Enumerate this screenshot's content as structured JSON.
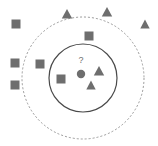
{
  "figure": {
    "width": 158,
    "height": 146,
    "background": "#ffffff"
  },
  "colors": {
    "marker_fill": "#6e6e6e",
    "inner_ring_stroke": "#4a4a4a",
    "outer_ring_stroke": "#9a9a9a",
    "query_dot": "#6e6e6e",
    "query_label": "#6e6e6e"
  },
  "query_point": {
    "label": "?",
    "label_x": 81,
    "label_y": 63,
    "dot_x": 81,
    "dot_y": 74,
    "dot_radius": 4.2
  },
  "rings": [
    {
      "name": "inner-neighborhood",
      "style": "solid",
      "cx": 83,
      "cy": 78,
      "r": 34,
      "stroke": "#4a4a4a",
      "stroke_width": 1.2,
      "dash": "none"
    },
    {
      "name": "outer-neighborhood",
      "style": "dashed",
      "cx": 83,
      "cy": 78,
      "r": 61,
      "stroke": "#9a9a9a",
      "stroke_width": 1,
      "dash": "2,2"
    }
  ],
  "legend_classes": [
    {
      "name": "class-square",
      "glyph": "square"
    },
    {
      "name": "class-triangle",
      "glyph": "triangle"
    }
  ],
  "markers": [
    {
      "id": "square-1",
      "shape": "square",
      "x": 16,
      "y": 24,
      "size": 9,
      "zone": "outside"
    },
    {
      "id": "square-2",
      "shape": "square",
      "x": 15,
      "y": 63,
      "size": 9,
      "zone": "outer-ring"
    },
    {
      "id": "square-3",
      "shape": "square",
      "x": 40,
      "y": 64,
      "size": 9,
      "zone": "outer-ring"
    },
    {
      "id": "square-4",
      "shape": "square",
      "x": 15,
      "y": 85,
      "size": 9,
      "zone": "outer-ring"
    },
    {
      "id": "square-5",
      "shape": "square",
      "x": 89,
      "y": 36,
      "size": 9,
      "zone": "outer-ring"
    },
    {
      "id": "square-6",
      "shape": "square",
      "x": 61,
      "y": 79,
      "size": 9,
      "zone": "inner-ring"
    },
    {
      "id": "triangle-1",
      "shape": "triangle",
      "x": 67,
      "y": 14,
      "size": 10,
      "zone": "outside"
    },
    {
      "id": "triangle-2",
      "shape": "triangle",
      "x": 107,
      "y": 12,
      "size": 10,
      "zone": "outside"
    },
    {
      "id": "triangle-3",
      "shape": "triangle",
      "x": 145,
      "y": 24,
      "size": 9,
      "zone": "outside"
    },
    {
      "id": "triangle-4",
      "shape": "triangle",
      "x": 99,
      "y": 71,
      "size": 10,
      "zone": "inner-ring"
    },
    {
      "id": "triangle-5",
      "shape": "triangle",
      "x": 91,
      "y": 85,
      "size": 9,
      "zone": "inner-ring"
    }
  ]
}
